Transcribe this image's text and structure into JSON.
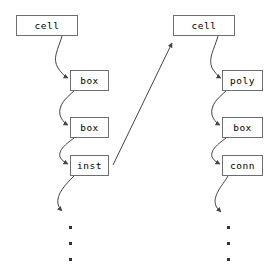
{
  "diagram": {
    "type": "linked-structure",
    "background_color": "#ffffff",
    "box_border_color": "#6e6e6e",
    "arrow_color": "#444444",
    "text_color": "#000000",
    "columns": [
      {
        "name": "left-column",
        "nodes": [
          {
            "label": "cell",
            "x": 16,
            "y": 15,
            "w": 62,
            "h": 21
          },
          {
            "label": "box",
            "x": 70,
            "y": 70,
            "w": 39,
            "h": 21
          },
          {
            "label": "box",
            "x": 70,
            "y": 117,
            "w": 39,
            "h": 21
          },
          {
            "label": "inst",
            "x": 70,
            "y": 155,
            "w": 39,
            "h": 21
          }
        ],
        "ellipsis_dots": [
          {
            "x": 69,
            "y": 226
          },
          {
            "x": 69,
            "y": 242
          },
          {
            "x": 69,
            "y": 258
          }
        ]
      },
      {
        "name": "right-column",
        "nodes": [
          {
            "label": "cell",
            "x": 173,
            "y": 15,
            "w": 62,
            "h": 21
          },
          {
            "label": "poly",
            "x": 222,
            "y": 70,
            "w": 41,
            "h": 21
          },
          {
            "label": "box",
            "x": 222,
            "y": 117,
            "w": 41,
            "h": 21
          },
          {
            "label": "conn",
            "x": 222,
            "y": 155,
            "w": 41,
            "h": 21
          }
        ],
        "ellipsis_dots": [
          {
            "x": 227,
            "y": 226
          },
          {
            "x": 227,
            "y": 242
          },
          {
            "x": 227,
            "y": 258
          }
        ]
      }
    ],
    "connectors": [
      {
        "name": "left-cell-to-box1",
        "kind": "curved-arrow",
        "from": "cell",
        "to": "box"
      },
      {
        "name": "left-box1-to-box2",
        "kind": "curved-arrow",
        "from": "box",
        "to": "box"
      },
      {
        "name": "left-box2-to-inst",
        "kind": "curved-arrow",
        "from": "box",
        "to": "inst"
      },
      {
        "name": "left-inst-to-dots",
        "kind": "curved-arrow",
        "from": "inst",
        "to": "ellipsis"
      },
      {
        "name": "inst-to-right-cell",
        "kind": "straight-arrow",
        "from": "inst",
        "to": "cell"
      },
      {
        "name": "right-cell-to-poly",
        "kind": "curved-arrow",
        "from": "cell",
        "to": "poly"
      },
      {
        "name": "right-poly-to-box",
        "kind": "curved-arrow",
        "from": "poly",
        "to": "box"
      },
      {
        "name": "right-box-to-conn",
        "kind": "curved-arrow",
        "from": "box",
        "to": "conn"
      },
      {
        "name": "right-conn-to-dots",
        "kind": "curved-arrow",
        "from": "conn",
        "to": "ellipsis"
      }
    ]
  }
}
